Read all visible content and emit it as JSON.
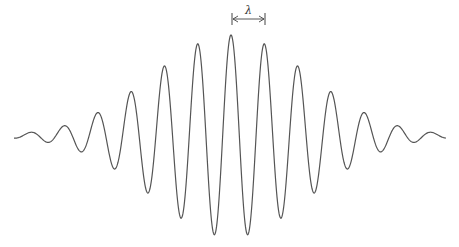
{
  "diagram": {
    "wavelength_label": "λ",
    "line_color": "#555555",
    "background": "#ffffff",
    "wave": {
      "center_x": 231,
      "baseline_y": 136,
      "period_px": 33.4,
      "amplitude_px": 101,
      "envelope_sigma_px": 78,
      "x_start": 14,
      "x_end": 446
    },
    "marker": {
      "x1": 232,
      "x2": 265,
      "y": 19,
      "label_x": 245,
      "label_y": 4
    }
  }
}
